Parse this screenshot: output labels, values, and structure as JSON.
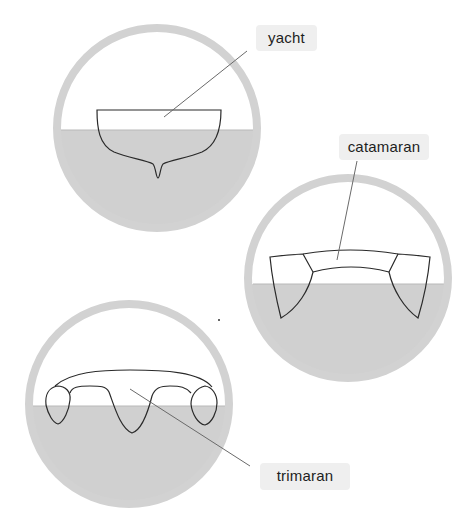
{
  "diagram": {
    "colors": {
      "ring": "#d2d2d2",
      "water": "#d0d0d0",
      "outline": "#2a2a2a",
      "leader": "#6a6a6a",
      "label_bg": "#efefef"
    },
    "panels": [
      {
        "id": "yacht",
        "label": "yacht",
        "circle": {
          "cx": 157,
          "cy": 128,
          "r": 100
        },
        "waterline_y": 130,
        "label_box": {
          "x": 256,
          "y": 25,
          "w": 61,
          "h": 26
        }
      },
      {
        "id": "catamaran",
        "label": "catamaran",
        "circle": {
          "cx": 348,
          "cy": 278,
          "r": 100
        },
        "waterline_y": 284,
        "label_box": {
          "x": 339,
          "y": 134,
          "w": 90,
          "h": 26
        }
      },
      {
        "id": "trimaran",
        "label": "trimaran",
        "circle": {
          "cx": 129,
          "cy": 404,
          "r": 100
        },
        "waterline_y": 406,
        "label_box": {
          "x": 260,
          "y": 463,
          "w": 90,
          "h": 27
        }
      }
    ]
  }
}
